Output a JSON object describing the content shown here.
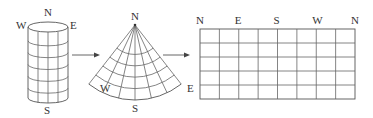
{
  "diagram": {
    "cylinder": {
      "labels": {
        "top": "N",
        "left": "W",
        "right": "E",
        "bottom": "S"
      },
      "meridians_visible": 3,
      "parallels": 5
    },
    "cone": {
      "labels": {
        "apex": "N",
        "left": "W",
        "right": "E",
        "bottom": "S"
      },
      "meridians": 5,
      "parallels": 4
    },
    "grid": {
      "top_labels": [
        "N",
        "E",
        "S",
        "W",
        "N"
      ],
      "columns": 8,
      "rows": 5
    },
    "colors": {
      "line": "#555555",
      "text": "#333333"
    }
  }
}
